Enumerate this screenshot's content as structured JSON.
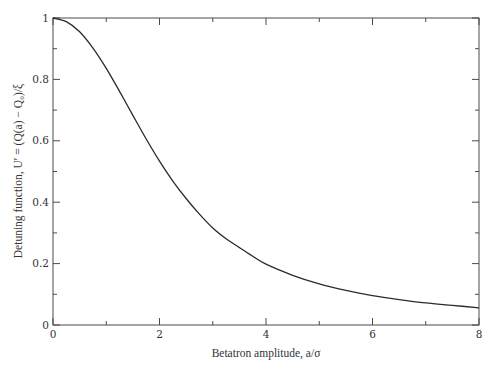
{
  "chart_data": {
    "type": "line",
    "title": "",
    "xlabel": "Betatron amplitude, a/σ",
    "ylabel": "Detuning function, U′ = (Q(a) − Q₀)/ξ",
    "xlim": [
      0,
      8
    ],
    "ylim": [
      0,
      1
    ],
    "grid": false,
    "legend": null,
    "x_ticks": [
      0,
      2,
      4,
      6,
      8
    ],
    "x_tick_labels": [
      "0",
      "2",
      "4",
      "6",
      "8"
    ],
    "x_minor_ticks": [
      1,
      3,
      5,
      7
    ],
    "y_ticks": [
      0,
      0.2,
      0.4,
      0.6,
      0.8,
      1
    ],
    "y_tick_labels": [
      "0",
      "0.2",
      "0.4",
      "0.6",
      "0.8",
      "1"
    ],
    "y_minor_ticks": [
      0.1,
      0.3,
      0.5,
      0.7,
      0.9
    ],
    "series": [
      {
        "name": "U′",
        "color": "#2b2b2b",
        "x": [
          0,
          0.25,
          0.5,
          0.75,
          1.0,
          1.25,
          1.5,
          1.75,
          2.0,
          2.25,
          2.5,
          2.75,
          3.0,
          3.25,
          3.5,
          3.75,
          4.0,
          4.5,
          5.0,
          5.5,
          6.0,
          6.5,
          7.0,
          7.5,
          8.0
        ],
        "y": [
          1.0,
          0.988,
          0.955,
          0.902,
          0.836,
          0.761,
          0.683,
          0.606,
          0.534,
          0.469,
          0.412,
          0.361,
          0.316,
          0.281,
          0.252,
          0.224,
          0.198,
          0.162,
          0.134,
          0.113,
          0.096,
          0.083,
          0.072,
          0.064,
          0.056
        ]
      }
    ]
  },
  "axes": {
    "x_title": "Betatron amplitude, a/σ",
    "y_title": "Detuning function, U′ = (Q(a) − Q₀)/ξ"
  }
}
